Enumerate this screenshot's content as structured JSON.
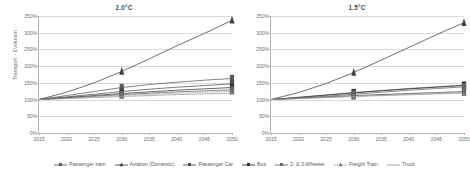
{
  "figure": {
    "ylabel": "Transport - Evolution",
    "xlabel": ""
  },
  "chart_data": {
    "type": "line",
    "title": "",
    "ylabel": "Transport - Evolution",
    "xlabel": "",
    "ylim": [
      0,
      350
    ],
    "yticks": [
      0,
      50,
      100,
      150,
      200,
      250,
      300,
      350
    ],
    "ytick_labels": [
      "0%",
      "50%",
      "100%",
      "150%",
      "200%",
      "250%",
      "300%",
      "350%"
    ],
    "xlim": [
      2015,
      2050
    ],
    "x": [
      2015,
      2020,
      2025,
      2030,
      2035,
      2040,
      2045,
      2050
    ],
    "xtick_labels": [
      "2015",
      "2020",
      "2025",
      "2030",
      "2035",
      "2040",
      "2045",
      "2050"
    ],
    "grid": true,
    "legend_position": "bottom",
    "panels": [
      {
        "title": "2.0°C",
        "series": [
          {
            "name": "Passenger train",
            "values": [
              100,
              112,
              124,
              136,
              145,
              152,
              158,
              163
            ]
          },
          {
            "name": "Aviation (Domestic)",
            "values": [
              100,
              122,
              150,
              184,
              222,
              261,
              298,
              337
            ]
          },
          {
            "name": "Passenger Car",
            "values": [
              100,
              108,
              116,
              124,
              131,
              137,
              142,
              147
            ]
          },
          {
            "name": "Bus",
            "values": [
              100,
              106,
              112,
              118,
              123,
              128,
              132,
              136
            ]
          },
          {
            "name": "2- & 3-Wheeler",
            "values": [
              100,
              105,
              110,
              115,
              119,
              123,
              126,
              129
            ]
          },
          {
            "name": "Freight Train",
            "values": [
              100,
              104,
              108,
              112,
              116,
              119,
              122,
              125
            ]
          },
          {
            "name": "Truck",
            "values": [
              100,
              103,
              106,
              109,
              112,
              115,
              117,
              119
            ]
          }
        ]
      },
      {
        "title": "1.5°C",
        "series": [
          {
            "name": "Passenger train",
            "values": [
              100,
              107,
              114,
              121,
              127,
              133,
              138,
              143
            ]
          },
          {
            "name": "Aviation (Domestic)",
            "values": [
              100,
              121,
              148,
              181,
              218,
              256,
              294,
              330
            ]
          },
          {
            "name": "Passenger Car",
            "values": [
              100,
              104,
              108,
              112,
              115,
              118,
              121,
              124
            ]
          },
          {
            "name": "Bus",
            "values": [
              100,
              106,
              113,
              120,
              126,
              132,
              137,
              142
            ]
          },
          {
            "name": "2- & 3-Wheeler",
            "values": [
              100,
              105,
              110,
              116,
              122,
              128,
              133,
              138
            ]
          },
          {
            "name": "Freight Train",
            "values": [
              100,
              103,
              107,
              110,
              113,
              116,
              118,
              121
            ]
          },
          {
            "name": "Truck",
            "values": [
              100,
              103,
              106,
              109,
              112,
              114,
              117,
              119
            ]
          }
        ]
      }
    ],
    "legend": [
      {
        "label": "Passenger train",
        "color": "#595959",
        "marker": "square",
        "dash": "none"
      },
      {
        "label": "Aviation (Domestic)",
        "color": "#404040",
        "marker": "triangle",
        "dash": "none"
      },
      {
        "label": "Passenger Car",
        "color": "#4d4d4d",
        "marker": "square",
        "dash": "none"
      },
      {
        "label": "Bus",
        "color": "#333333",
        "marker": "square",
        "dash": "none"
      },
      {
        "label": "2- & 3-Wheeler",
        "color": "#666666",
        "marker": "square",
        "dash": "none"
      },
      {
        "label": "Freight Train",
        "color": "#737373",
        "marker": "triangle",
        "dash": "dotted"
      },
      {
        "label": "Truck",
        "color": "#999999",
        "marker": "none",
        "dash": "none"
      }
    ]
  }
}
